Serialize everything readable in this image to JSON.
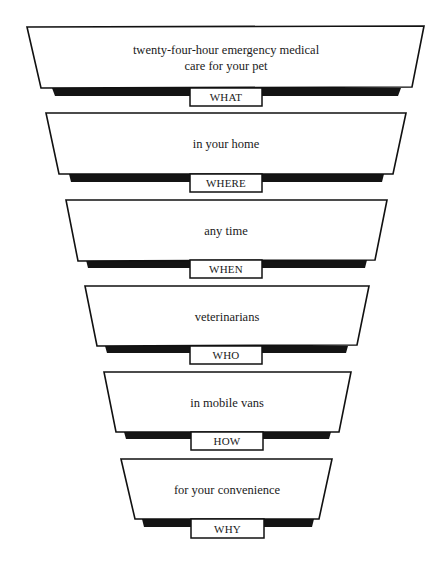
{
  "diagram": {
    "type": "inverted-funnel",
    "colors": {
      "stroke": "#111111",
      "shadow": "#141414",
      "fill": "#ffffff",
      "text": "#1a1a1a"
    },
    "stages": [
      {
        "label": "WHAT",
        "text": "twenty-four-hour emergency medical care for your pet",
        "line1": "twenty-four-hour emergency medical",
        "line2": "care for your pet"
      },
      {
        "label": "WHERE",
        "text": "in your home"
      },
      {
        "label": "WHEN",
        "text": "any time"
      },
      {
        "label": "WHO",
        "text": "veterinarians"
      },
      {
        "label": "HOW",
        "text": "in mobile vans"
      },
      {
        "label": "WHY",
        "text": "for your convenience"
      }
    ]
  }
}
